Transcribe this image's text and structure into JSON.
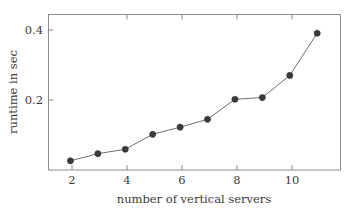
{
  "chart_data": {
    "type": "line",
    "title": "",
    "xlabel": "number of vertical servers",
    "ylabel": "runtime in sec",
    "x": [
      2,
      3,
      4,
      5,
      6,
      7,
      8,
      9,
      10,
      11
    ],
    "values": [
      0.027,
      0.048,
      0.061,
      0.105,
      0.126,
      0.149,
      0.208,
      0.213,
      0.278,
      0.402
    ],
    "series": [
      {
        "name": "runtime",
        "values": [
          0.027,
          0.048,
          0.061,
          0.105,
          0.126,
          0.149,
          0.208,
          0.213,
          0.278,
          0.402
        ]
      }
    ],
    "xlim": [
      1.2,
      11.85
    ],
    "ylim": [
      0.0,
      0.4571
    ],
    "xticks": [
      2,
      4,
      6,
      8,
      10
    ],
    "xtick_labels": [
      "2",
      "4",
      "6",
      "8",
      "10"
    ],
    "yticks": [
      0.2,
      0.4
    ],
    "ytick_labels": [
      "0.2",
      "0.4"
    ],
    "grid": false,
    "legend": "none",
    "marker": "filled-circle",
    "line_color": "#6f6f6f",
    "marker_color": "#3a3a3a",
    "frame_color": "#8c8c8c",
    "background": "#ffffff"
  }
}
